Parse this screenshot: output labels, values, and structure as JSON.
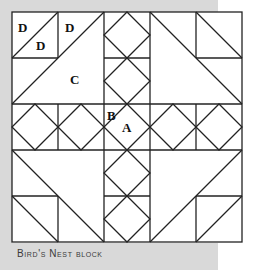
{
  "caption": "Bird's Nest block",
  "labels": {
    "d1": "D",
    "d2": "D",
    "d3": "D",
    "c": "C",
    "b": "B",
    "a": "A"
  },
  "colors": {
    "background": "#d9d9d9",
    "block_fill": "#ffffff",
    "line": "#222222"
  },
  "grid": {
    "columns": 5,
    "rows": 5
  }
}
